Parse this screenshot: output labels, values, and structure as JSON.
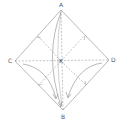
{
  "diagram": {
    "type": "origami-fold",
    "labels": {
      "top": "A",
      "bottom": "B",
      "left": "C",
      "right": "D",
      "center": "K"
    },
    "colors": {
      "line": "#8a8a8a",
      "text": "#555555",
      "background": "#ffffff"
    }
  }
}
